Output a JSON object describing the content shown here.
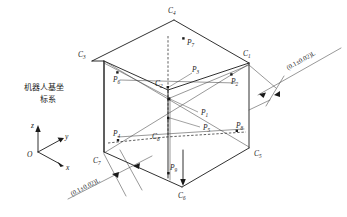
{
  "figure": {
    "caption_text": "机器人基坐标系",
    "frame_note_line1": "机器人基坐",
    "frame_note_line2": "标系",
    "dimension_label": "(0.1±0.02)L",
    "line_color": "#1a1a1a",
    "background": "#ffffff"
  },
  "coordinate_frame": {
    "origin_label": "O",
    "axes": [
      {
        "name": "z-axis",
        "label": "z",
        "direction": "up"
      },
      {
        "name": "y-axis",
        "label": "y",
        "direction": "upper-right"
      },
      {
        "name": "x-axis",
        "label": "x",
        "direction": "lower-right"
      }
    ]
  },
  "cube_vertices": [
    {
      "id": "C1",
      "base": "C",
      "sub": "1",
      "x": 246,
      "y": 56
    },
    {
      "id": "C2",
      "base": "C",
      "sub": "2",
      "x": 162,
      "y": 84
    },
    {
      "id": "C3",
      "base": "C",
      "sub": "3",
      "x": 84,
      "y": 57
    },
    {
      "id": "C4",
      "base": "C",
      "sub": "4",
      "x": 172,
      "y": 11
    },
    {
      "id": "C5",
      "base": "C",
      "sub": "5",
      "x": 255,
      "y": 153
    },
    {
      "id": "C6",
      "base": "C",
      "sub": "6",
      "x": 180,
      "y": 192
    },
    {
      "id": "C7",
      "base": "C",
      "sub": "7",
      "x": 96,
      "y": 157
    },
    {
      "id": "C8",
      "base": "C",
      "sub": "8",
      "x": 159,
      "y": 132
    }
  ],
  "measured_points": [
    {
      "id": "P1",
      "base": "P",
      "sub": "1",
      "x": 204,
      "y": 112
    },
    {
      "id": "P2",
      "base": "P",
      "sub": "2",
      "x": 233,
      "y": 80
    },
    {
      "id": "P3",
      "base": "P",
      "sub": "3",
      "x": 194,
      "y": 70
    },
    {
      "id": "P4",
      "base": "P",
      "sub": "4",
      "x": 118,
      "y": 135
    },
    {
      "id": "P5",
      "base": "P",
      "sub": "5",
      "x": 206,
      "y": 127
    },
    {
      "id": "P6",
      "base": "P",
      "sub": "6",
      "x": 118,
      "y": 78
    },
    {
      "id": "P7",
      "base": "P",
      "sub": "7",
      "x": 184,
      "y": 44
    },
    {
      "id": "P8",
      "base": "P",
      "sub": "8",
      "x": 239,
      "y": 128
    },
    {
      "id": "P9",
      "base": "P",
      "sub": "9",
      "x": 175,
      "y": 166
    }
  ],
  "annotations": [
    {
      "id": "dim-right",
      "label": "(0.1±0.02)L",
      "position": "upper-right"
    },
    {
      "id": "dim-left",
      "label": "(0.1±0.02)L",
      "position": "lower-left"
    }
  ]
}
